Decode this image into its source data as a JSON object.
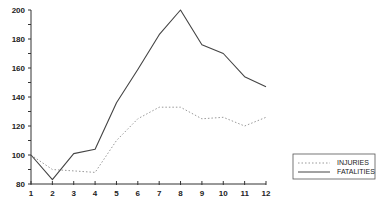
{
  "chart_data": {
    "type": "line",
    "title": "",
    "xlabel": "",
    "ylabel": "",
    "x": [
      1,
      2,
      3,
      4,
      5,
      6,
      7,
      8,
      9,
      10,
      11,
      12
    ],
    "xticks": [
      "1",
      "2",
      "3",
      "4",
      "5",
      "6",
      "7",
      "8",
      "9",
      "10",
      "11",
      "12"
    ],
    "yticks": [
      "80",
      "100",
      "120",
      "140",
      "160",
      "180",
      "200"
    ],
    "ylim": [
      80,
      200
    ],
    "xlim": [
      1,
      12
    ],
    "grid": false,
    "legend_position": "lower right",
    "series": [
      {
        "name": "INJURIES",
        "style": "dotted",
        "values": [
          100,
          90,
          89,
          88,
          110,
          125,
          133,
          133,
          125,
          126,
          120,
          126
        ]
      },
      {
        "name": "FATALITIES",
        "style": "solid",
        "values": [
          100,
          83,
          101,
          104,
          136,
          159,
          183,
          200,
          176,
          170,
          154,
          147
        ]
      }
    ]
  },
  "legend": {
    "items": [
      {
        "label": "INJURIES",
        "style": "dotted"
      },
      {
        "label": "FATALITIES",
        "style": "solid"
      }
    ]
  },
  "colors": {
    "line": "#444444",
    "dotted": "#999999",
    "axis": "#333333"
  }
}
